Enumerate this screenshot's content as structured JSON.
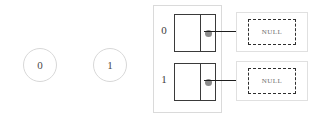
{
  "diagram": {
    "free_nodes": [
      {
        "label": "0",
        "icon": "circle-node-icon"
      },
      {
        "label": "1",
        "icon": "circle-node-icon"
      }
    ],
    "bucket_array": {
      "rows": [
        {
          "index_label": "0",
          "node": {
            "data_cell_value": "",
            "next_pointer_icon": "pointer-dot-icon",
            "arrow_icon": "arrow-right-icon",
            "target_label": "NULL"
          }
        },
        {
          "index_label": "1",
          "node": {
            "data_cell_value": "",
            "next_pointer_icon": "pointer-dot-icon",
            "arrow_icon": "arrow-right-icon",
            "target_label": "NULL"
          }
        }
      ]
    },
    "colors": {
      "node_border": "#3a3a3a",
      "container_border": "#dadada",
      "null_border": "#2e2e2e",
      "null_text": "#6d6d6d",
      "pointer_dot": "#8a8a8a",
      "circle_border": "#d8d8d8",
      "arrow": "#1e1e1e",
      "background": "#ffffff"
    }
  }
}
